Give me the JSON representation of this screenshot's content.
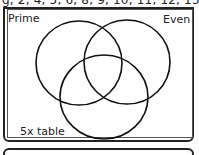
{
  "header": {
    "text": "g, 2, 4, 5, 6, 8, 9, 10, 11, 12, 15"
  },
  "venn": {
    "sets": [
      {
        "id": "prime",
        "label": "Prime"
      },
      {
        "id": "even",
        "label": "Even"
      },
      {
        "id": "five",
        "label": "5x table"
      }
    ]
  }
}
